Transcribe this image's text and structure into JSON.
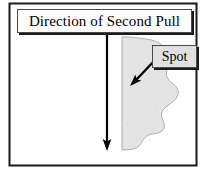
{
  "figure": {
    "name": "second-pull-direction-diagram",
    "frame": {
      "border_color": "#1a1a1a",
      "background_color": "#ffffff"
    },
    "labels": {
      "title": {
        "text": "Direction of Second Pull",
        "fill_color": "#ffffff",
        "border_color": "#4a4a4a",
        "shadow_color": "#1a1a1a"
      },
      "spot": {
        "text": "Spot",
        "fill_color": "#e0e0e0",
        "border_color": "#4a4a4a",
        "shadow_color": "#1a1a1a"
      }
    },
    "shapes": {
      "blob": {
        "name": "spot-region",
        "fill_color": "#e3e3e3",
        "outline_color": "#9a9a9a"
      }
    },
    "arrows": {
      "pull_direction": {
        "name": "downward-pull-arrow",
        "color": "#000000",
        "orientation": "vertical-down"
      },
      "spot_pointer": {
        "name": "spot-callout-arrow",
        "color": "#000000",
        "orientation": "diagonal-down-left"
      }
    }
  }
}
